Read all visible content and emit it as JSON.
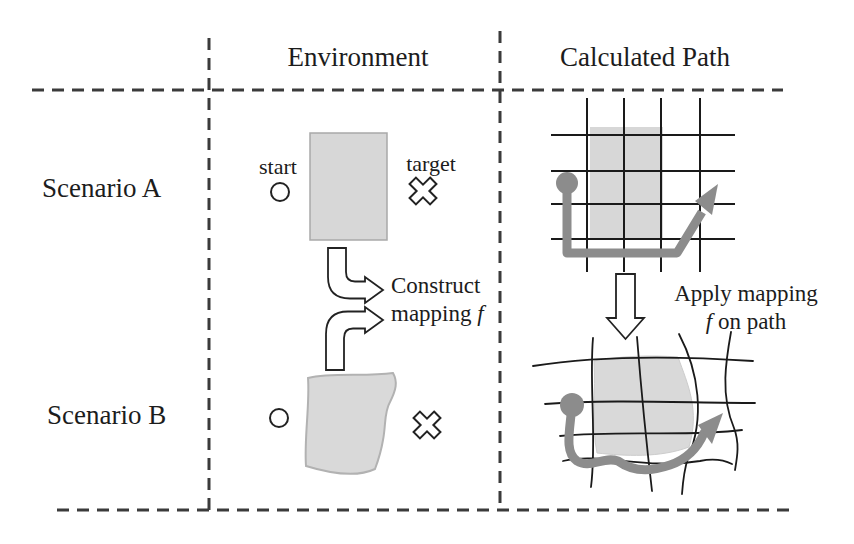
{
  "figure": {
    "columns": {
      "environment": "Environment",
      "calculated_path": "Calculated Path"
    },
    "rows": {
      "scenario_a": "Scenario A",
      "scenario_b": "Scenario B"
    },
    "environment_labels": {
      "start": "start",
      "target": "target"
    },
    "annotations": {
      "construct": {
        "line1": "Construct",
        "line2_word": "mapping",
        "f": "f"
      },
      "apply": {
        "line1": "Apply mapping",
        "f": "f",
        "line2_rest": "on path"
      }
    },
    "markers": {
      "start_marker": "open-circle",
      "target_marker": "x-cross",
      "path_start_marker": "filled-gray-circle",
      "path_end_marker": "gray-arrowhead",
      "mapping_arrows": "hollow-bent-arrows",
      "apply_arrow": "hollow-down-arrow"
    },
    "colors": {
      "text": "#1c1c1c",
      "dashed_line": "#3b3b3b",
      "grid_line": "#1a1a1a",
      "shape_fill": "#d7d7d7",
      "shape_stroke": "#a9a9a9",
      "blob_fill": "#d9d9d9",
      "blob_stroke": "#b2b2b2",
      "path_gray": "#8c8c8c",
      "background": "#ffffff"
    }
  }
}
